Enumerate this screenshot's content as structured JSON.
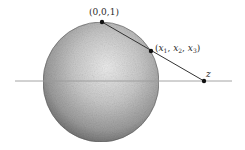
{
  "diagram": {
    "type": "stereographic-projection",
    "colors": {
      "background": "#ffffff",
      "sphere_light": "#e6e6e6",
      "sphere_mid": "#b4b4b4",
      "sphere_dark": "#6e6e6e",
      "plane_line": "#9a9a9a",
      "projection_line": "#333333",
      "point": "#111111",
      "label": "#2a2a2a"
    },
    "labels": {
      "north_pole": "(0,0,1)",
      "sphere_point": {
        "open": "(",
        "x1": "x",
        "s1": "1",
        "sep1": ", ",
        "x2": "x",
        "s2": "2",
        "sep2": ", ",
        "x3": "x",
        "s3": "3",
        "close": ")"
      },
      "plane_point": "z"
    },
    "points": [
      {
        "name": "north-pole",
        "label": "(0,0,1)",
        "x": 102,
        "y": 22
      },
      {
        "name": "sphere-point",
        "label": "(x1, x2, x3)",
        "x": 151,
        "y": 51
      },
      {
        "name": "plane-point",
        "label": "z",
        "x": 204,
        "y": 81
      }
    ],
    "sphere": {
      "cx": 101,
      "cy": 82,
      "rx": 58,
      "ry": 60
    },
    "plane_line": {
      "x1": 15,
      "y1": 81,
      "x2": 232,
      "y2": 81
    }
  }
}
